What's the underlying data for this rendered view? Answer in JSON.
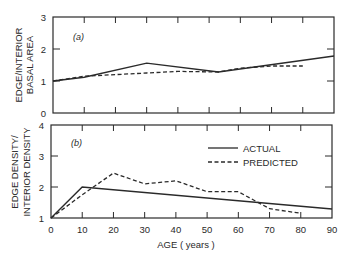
{
  "chart_data": [
    {
      "type": "line",
      "panel_label": "(a)",
      "title": "",
      "xlabel": "AGE (years)",
      "ylabel": "EDGE/INTERIOR BASAL AREA",
      "ylabel_lines": [
        "EDGE/INTERIOR",
        "BASAL AREA"
      ],
      "xlim": [
        0,
        90
      ],
      "ylim": [
        0,
        3
      ],
      "yticks": [
        "0",
        "1",
        "2",
        "3"
      ],
      "xticks": [
        0,
        10,
        20,
        30,
        40,
        50,
        60,
        70,
        80,
        90
      ],
      "grid": false,
      "series": [
        {
          "name": "ACTUAL",
          "style": "solid",
          "x": [
            0,
            10,
            30,
            53,
            90
          ],
          "y": [
            1.0,
            1.12,
            1.56,
            1.28,
            1.78
          ]
        },
        {
          "name": "PREDICTED",
          "style": "dashed",
          "x": [
            0,
            10,
            30,
            40,
            53,
            60,
            70,
            80
          ],
          "y": [
            1.0,
            1.15,
            1.25,
            1.3,
            1.28,
            1.4,
            1.47,
            1.47
          ]
        }
      ]
    },
    {
      "type": "line",
      "panel_label": "(b)",
      "title": "",
      "xlabel": "AGE (years)",
      "ylabel": "EDGE DENSITY/ INTERIOR DENSITY",
      "ylabel_lines": [
        "EDGE DENSITY/",
        "INTERIOR DENSITY"
      ],
      "xlim": [
        0,
        90
      ],
      "ylim": [
        1,
        4
      ],
      "yticks": [
        "1",
        "2",
        "3",
        "4"
      ],
      "xticks": [
        "0",
        "10",
        "20",
        "30",
        "40",
        "50",
        "60",
        "70",
        "80",
        "90"
      ],
      "grid": false,
      "legend": {
        "position": "upper right",
        "entries": [
          "ACTUAL",
          "PREDICTED"
        ]
      },
      "series": [
        {
          "name": "ACTUAL",
          "style": "solid",
          "x": [
            0,
            10,
            90
          ],
          "y": [
            1.0,
            2.0,
            1.29
          ]
        },
        {
          "name": "PREDICTED",
          "style": "dashed",
          "x": [
            0,
            10,
            20,
            30,
            40,
            50,
            60,
            70,
            80
          ],
          "y": [
            1.0,
            1.75,
            2.45,
            2.1,
            2.2,
            1.85,
            1.85,
            1.3,
            1.15
          ]
        }
      ]
    }
  ],
  "labels": {
    "panel_a": "(a)",
    "panel_b": "(b)",
    "ylabel_a_1": "EDGE/INTERIOR",
    "ylabel_a_2": "BASAL AREA",
    "ylabel_b_1": "EDGE DENSITY/",
    "ylabel_b_2": "INTERIOR DENSITY",
    "xlabel": "AGE ( years )",
    "legend_actual": "ACTUAL",
    "legend_predicted": "PREDICTED",
    "yticks_a": [
      "0",
      "1",
      "2",
      "3"
    ],
    "yticks_b": [
      "1",
      "2",
      "3",
      "4"
    ],
    "xticks": [
      "0",
      "10",
      "20",
      "30",
      "40",
      "50",
      "60",
      "70",
      "80",
      "90"
    ]
  },
  "colors": {
    "ink": "#2a2a2a",
    "background": "#ffffff"
  }
}
